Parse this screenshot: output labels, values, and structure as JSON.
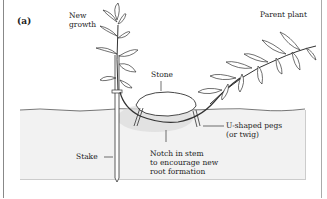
{
  "figure": {
    "panel_label": "(a)",
    "labels": {
      "new_growth_1": "New",
      "new_growth_2": "growth",
      "parent_plant": "Parent plant",
      "stone": "Stone",
      "stake": "Stake",
      "pegs_1": "U-shaped pegs",
      "pegs_2": "(or twig)",
      "notch_1": "Notch in stem",
      "notch_2": "to encourage new",
      "notch_3": "root formation"
    },
    "colors": {
      "line": "#333333",
      "soil": "#f2f2f2",
      "background": "#ffffff"
    }
  }
}
